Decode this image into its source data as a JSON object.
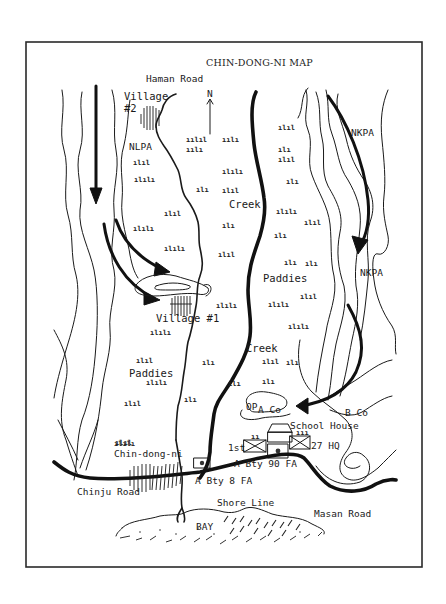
{
  "map": {
    "title": "CHIN-DONG-NI MAP",
    "north_arrow": {
      "label": "N"
    },
    "roads": {
      "haman": "Haman Road",
      "chinju": "Chinju Road",
      "masan": "Masan Road"
    },
    "villages": {
      "village2_line1": "Village",
      "village2_line2": "#2",
      "village1": "Village #1",
      "town": "Chin-dong-ni"
    },
    "enemy_forces": {
      "west": "NLPA",
      "east_upper": "NKPA",
      "east_lower": "NKPA"
    },
    "terrain": {
      "creek_upper": "Creek",
      "creek_lower": "Creek",
      "paddies_east": "Paddies",
      "paddies_west": "Paddies",
      "shore_line": "Shore Line",
      "bay": "BAY"
    },
    "units": {
      "op": "OP",
      "a_co": "A Co",
      "b_co": "B Co",
      "school_house": "School House",
      "first_bn": "1st",
      "regt_hq": "27 HQ",
      "a_bty_90fa": "A Bty 90 FA",
      "a_bty_8fa": "A Bty 8 FA"
    },
    "colors": {
      "ink": "#1a1a1a",
      "paper": "#ffffff",
      "frame": "#2a2a2a"
    }
  }
}
